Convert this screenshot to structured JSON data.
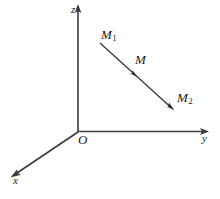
{
  "figure": {
    "background_color": "#ffffff",
    "width": 220,
    "height": 199,
    "axis_color": "#3a3a3a",
    "vector_color": "#2e2e2e",
    "label_color": "#1a1a1a"
  },
  "axes": {
    "z": {
      "label": "z",
      "direction": "up",
      "origin_px": [
        78,
        132
      ],
      "tip_px": [
        78,
        7
      ]
    },
    "y": {
      "label": "y",
      "direction": "right",
      "origin_px": [
        78,
        132
      ],
      "tip_px": [
        208,
        131
      ]
    },
    "x": {
      "label": "x",
      "direction": "down-left",
      "origin_px": [
        78,
        132
      ],
      "tip_px": [
        11,
        177
      ]
    }
  },
  "origin": {
    "label": "O",
    "position_px": [
      78,
      132
    ]
  },
  "vector": {
    "start_label": "M",
    "start_sub": "1",
    "mid_label": "M",
    "end_label": "M",
    "end_sub": "2",
    "start_px": [
      100,
      43
    ],
    "mid_px": [
      133,
      73
    ],
    "end_px": [
      173,
      109
    ],
    "has_mid_arrow": true,
    "has_end_arrow": true
  },
  "labels": {
    "z_axis": "z",
    "y_axis": "y",
    "x_axis": "x",
    "origin": "O",
    "point_m1_base": "M",
    "point_m1_sub": "1",
    "point_m": "M",
    "point_m2_base": "M",
    "point_m2_sub": "2"
  }
}
